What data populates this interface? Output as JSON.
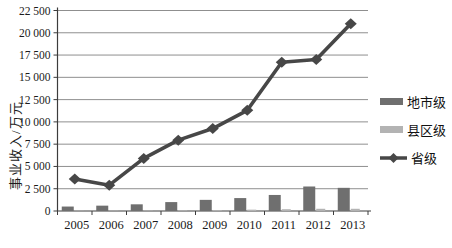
{
  "chart_data": {
    "type": "bar",
    "subtype": "bar-line-combo",
    "title": "",
    "xlabel": "",
    "ylabel": "事业收入/万元",
    "categories": [
      "2005",
      "2006",
      "2007",
      "2008",
      "2009",
      "2010",
      "2011",
      "2012",
      "2013"
    ],
    "series": [
      {
        "name": "地市级",
        "type": "bar",
        "color": "#6f6f6f",
        "values": [
          500,
          600,
          750,
          1000,
          1250,
          1450,
          1800,
          2750,
          2600
        ]
      },
      {
        "name": "县区级",
        "type": "bar",
        "color": "#b3b3b3",
        "values": [
          30,
          40,
          50,
          70,
          90,
          150,
          200,
          250,
          250
        ]
      },
      {
        "name": "省级",
        "type": "line",
        "marker": "diamond",
        "color": "#474747",
        "values": [
          3600,
          2900,
          5900,
          7950,
          9250,
          11300,
          16700,
          17000,
          21000
        ]
      }
    ],
    "ylim": [
      0,
      22500
    ],
    "ytick_interval": 2500,
    "ytick_labels": [
      "0",
      "2 500",
      "5 000",
      "7 500",
      "10 000",
      "12 500",
      "15 000",
      "17 500",
      "20 000",
      "22 500"
    ],
    "grid": "horizontal",
    "legend_position": "right"
  },
  "colors": {
    "axis": "#3c3c3c",
    "gridline": "#8f8f8f",
    "text": "#1b1b1b",
    "background": "#ffffff"
  }
}
